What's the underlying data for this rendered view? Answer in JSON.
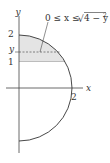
{
  "diagram": {
    "axes": {
      "x_label": "x",
      "y_label": "y"
    },
    "y_ticks": [
      {
        "label": "2",
        "value": 2
      },
      {
        "label": "y",
        "value": "y"
      },
      {
        "label": "1",
        "value": 1
      }
    ],
    "x_ticks": [
      {
        "label": "2",
        "value": 2
      }
    ],
    "annotation": {
      "prefix": "0 ≤ x ≤ ",
      "radical": "√",
      "radicand": "4 − y",
      "exponent": "2"
    },
    "curve": "right half of circle x² + y² = 4",
    "shaded_region": "between y = 1 and y = 2 inside the circle",
    "colors": {
      "stroke": "#333333",
      "shade": "#e4e4e4",
      "dashed": "#666666"
    }
  }
}
